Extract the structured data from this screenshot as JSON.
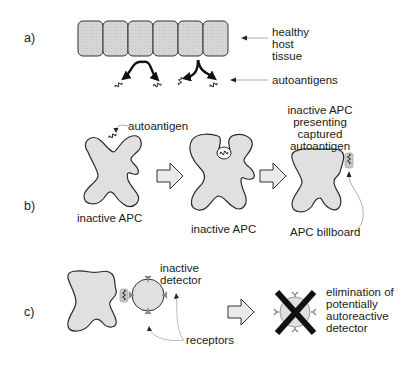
{
  "panels": {
    "a": {
      "label": "a)",
      "tissue_label_1": "healthy",
      "tissue_label_2": "host",
      "tissue_label_3": "tissue",
      "antigen_label": "autoantigens",
      "cell_count": 6
    },
    "b": {
      "label": "b)",
      "autoantigen_label": "autoantigen",
      "apc1_label": "inactive APC",
      "apc2_label": "inactive APC",
      "apc3_label_1": "inactive APC",
      "apc3_label_2": "presenting",
      "apc3_label_3": "captured",
      "apc3_label_4": "autoantigen",
      "billboard_label": "APC billboard"
    },
    "c": {
      "label": "c)",
      "detector_label_1": "inactive",
      "detector_label_2": "detector",
      "receptors_label": "receptors",
      "elim_label_1": "elimination of",
      "elim_label_2": "potentially",
      "elim_label_3": "autoreactive",
      "elim_label_4": "detector"
    }
  },
  "colors": {
    "cell_fill": "#d4d4d4",
    "apc_fill": "#e0e0e0",
    "outline": "#2a2a2a",
    "receptor": "#8a8a8a",
    "cross": "#111111"
  }
}
